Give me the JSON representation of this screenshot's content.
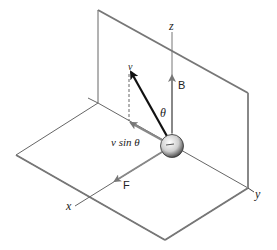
{
  "diagram": {
    "labels": {
      "z_axis": "z",
      "x_axis": "x",
      "y_axis": "y",
      "velocity": "v",
      "magnetic_field": "B",
      "angle": "θ",
      "perpendicular_component": "v sin θ",
      "force": "F"
    },
    "elements": [
      {
        "name": "vertical-plane",
        "description": "yz plane"
      },
      {
        "name": "horizontal-plane",
        "description": "xy plane"
      },
      {
        "name": "charged-particle",
        "description": "sphere at origin"
      },
      {
        "name": "velocity-vector",
        "description": "bold arrow v at angle θ from z"
      },
      {
        "name": "magnetic-field-vector",
        "description": "arrow B along +z"
      },
      {
        "name": "force-vector",
        "description": "arrow F along +x"
      },
      {
        "name": "v-sin-theta-component",
        "description": "projection arrow with dashed drop line"
      }
    ],
    "colors": {
      "line": "#555555",
      "vector_bold": "#111111",
      "vector_gray": "#777777"
    }
  }
}
